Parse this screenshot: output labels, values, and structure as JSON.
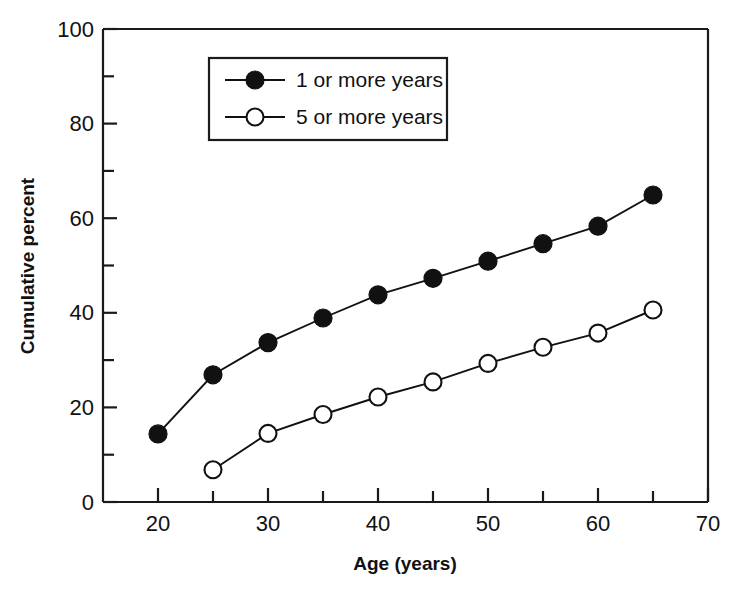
{
  "chart_data": {
    "type": "line",
    "title": "",
    "xlabel": "Age (years)",
    "ylabel": "Cumulative percent",
    "xlim": [
      15,
      70
    ],
    "ylim": [
      0,
      100
    ],
    "grid": false,
    "legend_position": "top-center",
    "x_ticks_major": [
      20,
      30,
      40,
      50,
      60,
      70
    ],
    "x_ticks_minor": [
      25,
      35,
      45,
      55,
      65
    ],
    "x_tick_labels": [
      "20",
      "30",
      "40",
      "50",
      "60",
      "70"
    ],
    "y_ticks_major": [
      0,
      20,
      40,
      60,
      80,
      100
    ],
    "y_ticks_minor": [
      10,
      30,
      50,
      70,
      90
    ],
    "y_tick_labels": [
      "0",
      "20",
      "40",
      "60",
      "80",
      "100"
    ],
    "series": [
      {
        "name": "1 or more years",
        "marker": "filled-circle",
        "x": [
          20,
          25,
          30,
          35,
          40,
          45,
          50,
          55,
          60,
          65
        ],
        "values": [
          14.4,
          26.9,
          33.7,
          38.9,
          43.8,
          47.3,
          50.9,
          54.6,
          58.3,
          64.9
        ]
      },
      {
        "name": "5 or more years",
        "marker": "open-circle",
        "x": [
          25,
          30,
          35,
          40,
          45,
          50,
          55,
          60,
          65
        ],
        "values": [
          6.8,
          14.5,
          18.5,
          22.2,
          25.4,
          29.3,
          32.7,
          35.7,
          40.6
        ]
      }
    ]
  },
  "legend": {
    "entries": [
      {
        "label": "1 or more years",
        "marker": "filled-circle"
      },
      {
        "label": "5 or more years",
        "marker": "open-circle"
      }
    ]
  },
  "colors": {
    "ink": "#111111",
    "axis": "#1a1a1a",
    "background": "#ffffff"
  }
}
